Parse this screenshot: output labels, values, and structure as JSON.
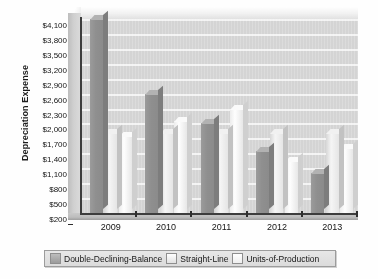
{
  "chart_data": {
    "type": "bar",
    "title": "",
    "subtitle": "",
    "xlabel": "",
    "ylabel": "Depreciation Expense",
    "categories": [
      "2009",
      "2010",
      "2011",
      "2012",
      "2013"
    ],
    "series": [
      {
        "name": "Double-Declining-Balance",
        "values": [
          4100,
          2600,
          2000,
          1450,
          1000
        ],
        "color": "#8e8e8e"
      },
      {
        "name": "Straight-Line",
        "values": [
          1800,
          1800,
          1800,
          1800,
          1800
        ],
        "color": "#e6e6e6"
      },
      {
        "name": "Units-of-Production",
        "values": [
          1750,
          2050,
          2300,
          1250,
          1500
        ],
        "color": "#f4f4f4"
      }
    ],
    "ylim": [
      200,
      4100
    ],
    "ytick_step": 300,
    "ytick_labels": [
      "$4,100",
      "$3,800",
      "$3,500",
      "$3,200",
      "$2,900",
      "$2,600",
      "$2,300",
      "$2,000",
      "$1,700",
      "$1,400",
      "$1,100",
      "$800",
      "$500",
      "$200"
    ],
    "ytick_values": [
      4100,
      3800,
      3500,
      3200,
      2900,
      2600,
      2300,
      2000,
      1700,
      1400,
      1100,
      800,
      500,
      200
    ],
    "grid": true,
    "grid_axis": "y",
    "legend_position": "bottom",
    "style": "3d-column",
    "palette": "grayscale",
    "plot_background": "#d4d4d4",
    "figure_background": "#ffffff",
    "axis_color": "#3a3a3a"
  },
  "legend": {
    "items": [
      {
        "label": "Double-Declining-Balance",
        "swatch_class": "sw0"
      },
      {
        "label": "Straight-Line",
        "swatch_class": "sw1"
      },
      {
        "label": "Units-of-Production",
        "swatch_class": "sw2"
      }
    ]
  }
}
